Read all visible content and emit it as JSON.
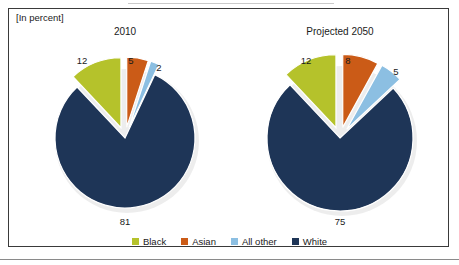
{
  "figure": {
    "unit_label": "[In percent]",
    "frame_color": "#3a3a3a",
    "background": "#ffffff"
  },
  "legend": {
    "position": "bottom-center",
    "entries": [
      {
        "label": "Black",
        "color": "#b5c22b"
      },
      {
        "label": "Asian",
        "color": "#cb5b17"
      },
      {
        "label": "All other",
        "color": "#8cbfe2"
      },
      {
        "label": "White",
        "color": "#1e3557"
      }
    ]
  },
  "chart_data": [
    {
      "type": "pie",
      "title": "2010",
      "unit": "percent",
      "categories": [
        "Black",
        "Asian",
        "All other",
        "White"
      ],
      "values": [
        12,
        5,
        2,
        81
      ],
      "colors": [
        "#b5c22b",
        "#cb5b17",
        "#8cbfe2",
        "#1e3557"
      ],
      "exploded": [
        "Black",
        "Asian",
        "All other"
      ],
      "labels": [
        "12",
        "5",
        "2",
        "81"
      ],
      "start_angle_oclock": 12,
      "direction": "clockwise",
      "slice_order_clockwise": [
        "Asian",
        "All other",
        "White",
        "Black"
      ]
    },
    {
      "type": "pie",
      "title": "Projected 2050",
      "unit": "percent",
      "categories": [
        "Black",
        "Asian",
        "All other",
        "White"
      ],
      "values": [
        12,
        8,
        5,
        75
      ],
      "colors": [
        "#b5c22b",
        "#cb5b17",
        "#8cbfe2",
        "#1e3557"
      ],
      "exploded": [
        "Black",
        "Asian",
        "All other"
      ],
      "labels": [
        "12",
        "8",
        "5",
        "75"
      ],
      "start_angle_oclock": 12,
      "direction": "clockwise",
      "slice_order_clockwise": [
        "Asian",
        "All other",
        "White",
        "Black"
      ]
    }
  ],
  "left_chart_labels": {
    "black": "12",
    "asian": "5",
    "all_other": "2",
    "white": "81",
    "title": "2010"
  },
  "right_chart_labels": {
    "black": "12",
    "asian": "8",
    "all_other": "5",
    "white": "75",
    "title": "Projected 2050"
  }
}
